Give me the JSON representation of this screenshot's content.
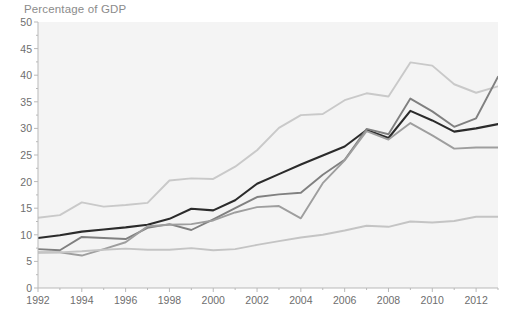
{
  "chart_data": {
    "type": "line",
    "title": "Percentage of GDP",
    "xlabel": "",
    "ylabel": "Percentage of GDP",
    "xlim": [
      1992,
      2013
    ],
    "ylim": [
      0,
      50
    ],
    "yticks": [
      0,
      5,
      10,
      15,
      20,
      25,
      30,
      35,
      40,
      45,
      50
    ],
    "xticks": [
      1992,
      1994,
      1996,
      1998,
      2000,
      2002,
      2004,
      2006,
      2008,
      2010,
      2012
    ],
    "xtick_labels": [
      "1992",
      "1994",
      "1996",
      "1998",
      "2000",
      "2002",
      "2004",
      "2006",
      "2008",
      "2010",
      "2012"
    ],
    "ytick_labels": [
      "0",
      "5",
      "10",
      "15",
      "20",
      "25",
      "30",
      "35",
      "40",
      "45",
      "50"
    ],
    "grid": false,
    "legend": "none",
    "x": [
      1992,
      1993,
      1994,
      1995,
      1996,
      1997,
      1998,
      1999,
      2000,
      2001,
      2002,
      2003,
      2004,
      2005,
      2006,
      2007,
      2008,
      2009,
      2010,
      2011,
      2012,
      2013
    ],
    "series": [
      {
        "name": "series-top-light",
        "color": "#c9c9c9",
        "values": [
          13.2,
          13.7,
          16.1,
          15.3,
          15.6,
          16.0,
          20.2,
          20.6,
          20.5,
          22.8,
          25.9,
          30.1,
          32.5,
          32.7,
          35.3,
          36.6,
          36.0,
          42.4,
          41.8,
          38.3,
          36.7,
          37.9
        ]
      },
      {
        "name": "series-dark",
        "color": "#2b2b2b",
        "values": [
          9.4,
          9.9,
          10.6,
          11.0,
          11.4,
          11.9,
          13.0,
          14.9,
          14.6,
          16.5,
          19.6,
          21.4,
          23.2,
          24.9,
          26.6,
          29.7,
          28.2,
          33.3,
          31.5,
          29.4,
          30.0,
          30.8
        ]
      },
      {
        "name": "series-mid-gray",
        "color": "#808080",
        "values": [
          7.3,
          7.1,
          9.6,
          9.4,
          9.2,
          11.3,
          12.0,
          10.9,
          12.9,
          15.0,
          17.1,
          17.6,
          17.9,
          21.3,
          24.1,
          29.9,
          28.9,
          35.6,
          33.2,
          30.3,
          31.9,
          39.7
        ]
      },
      {
        "name": "series-light-gray",
        "color": "#9e9e9e",
        "values": [
          6.7,
          6.7,
          6.1,
          7.3,
          8.6,
          11.6,
          11.9,
          12.0,
          12.7,
          14.2,
          15.2,
          15.4,
          13.1,
          19.7,
          24.0,
          29.5,
          27.9,
          31.0,
          28.7,
          26.2,
          26.4,
          26.4
        ]
      },
      {
        "name": "series-bottom-light",
        "color": "#c4c4c4",
        "values": [
          6.6,
          6.7,
          6.9,
          7.2,
          7.4,
          7.2,
          7.2,
          7.5,
          7.1,
          7.3,
          8.1,
          8.8,
          9.5,
          10.0,
          10.8,
          11.7,
          11.5,
          12.5,
          12.3,
          12.6,
          13.4,
          13.4
        ]
      }
    ]
  }
}
